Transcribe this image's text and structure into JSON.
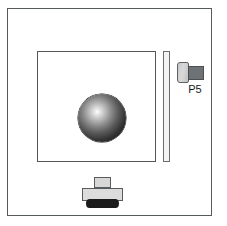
{
  "figure": {
    "title": "",
    "background_color": "#ffffff",
    "outline_color": "#55585a"
  },
  "outer_panel": {
    "name": "enclosure-panel",
    "label": "",
    "fill": "#ffffff",
    "stroke": "#555a5c"
  },
  "inner_plate": {
    "name": "inner-plate",
    "label": "",
    "fill": "#ffffff",
    "stroke": "#55585a"
  },
  "sphere": {
    "name": "spherical-element",
    "label": "",
    "highlight_color": "#ffffff",
    "shadow_color": "#0d0d0d"
  },
  "thin_bar": {
    "name": "vertical-bar",
    "label": "",
    "fill": "#f3f3f3",
    "stroke": "#6a6d6f"
  },
  "connector": {
    "name": "p5-connector",
    "label": "P5",
    "body_color": "#d0d0d0",
    "plug_color": "#6e7274",
    "stroke": "#5e6163"
  },
  "mount": {
    "name": "base-mount",
    "cap_label": "",
    "base_label": "",
    "foot_label": "",
    "cap_color": "#d7d7d7",
    "base_color": "#dcdcdc",
    "foot_color": "#1b1b1b"
  }
}
